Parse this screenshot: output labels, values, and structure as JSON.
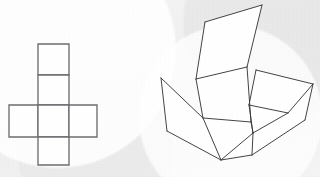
{
  "figure": {
    "background_color": "#f3f3f3",
    "width": 320,
    "height": 177,
    "line_color": "#3a3a3e",
    "net_line_color": "#6e6e72",
    "face_fill": "#ffffff"
  },
  "net": {
    "label": "cube-net-cross",
    "description": "Cross shaped net of six squares: four stacked vertically with two side squares at the third row",
    "square_size": 31,
    "origin": {
      "x": 9,
      "y": 44
    },
    "faces": [
      {
        "name": "net-square-top",
        "points": "38,44 69,44 69,75 38,75"
      },
      {
        "name": "net-square-upper-middle",
        "points": "38,75 69,75 69,105 38,105"
      },
      {
        "name": "net-square-left",
        "points": "9,105 38,105 38,137 9,137"
      },
      {
        "name": "net-square-center",
        "points": "38,105 69,105 69,137 38,137"
      },
      {
        "name": "net-square-right",
        "points": "69,105 97,105 97,137 69,137"
      },
      {
        "name": "net-square-bottom",
        "points": "38,137 69,137 69,165 38,165"
      }
    ]
  },
  "box": {
    "label": "open-box-3d",
    "description": "Three dimensional open box drawn in oblique projection with four unfolded flaps",
    "faces": [
      {
        "name": "box-flap-back-upper",
        "points": "205,22 262,5 247,67 196,79"
      },
      {
        "name": "box-panel-back",
        "points": "196,79 247,67 251,122 203,118"
      },
      {
        "name": "box-panel-left",
        "points": "161,78 203,118 221,160 167,131"
      },
      {
        "name": "box-panel-front",
        "points": "203,118 251,122 253,133 221,160"
      },
      {
        "name": "box-flap-right-upper",
        "points": "256,70 313,84 288,113 249,105"
      },
      {
        "name": "box-panel-right",
        "points": "249,105 288,113 313,84 305,120 252,155 221,160 253,133"
      },
      {
        "name": "box-panel-right-lower",
        "points": "253,133 252,155 305,120 288,113 249,105"
      }
    ],
    "edges": [
      {
        "name": "box-edge-flap-back-left",
        "d": "M205,22 L196,79"
      },
      {
        "name": "box-edge-flap-back-top",
        "d": "M205,22 L262,5"
      },
      {
        "name": "box-edge-flap-back-right",
        "d": "M262,5 L247,67"
      },
      {
        "name": "box-edge-back-fold",
        "d": "M196,79 L247,67"
      },
      {
        "name": "box-edge-back-left-side",
        "d": "M196,79 L203,118"
      },
      {
        "name": "box-edge-back-right-side",
        "d": "M247,67 L251,122"
      },
      {
        "name": "box-edge-back-bottom",
        "d": "M203,118 L251,122"
      },
      {
        "name": "box-edge-left-top",
        "d": "M161,78 L203,118"
      },
      {
        "name": "box-edge-left-outer",
        "d": "M161,78 L167,131"
      },
      {
        "name": "box-edge-left-bottom",
        "d": "M167,131 L221,160"
      },
      {
        "name": "box-edge-left-inner",
        "d": "M203,118 L221,160"
      },
      {
        "name": "box-edge-front-floor",
        "d": "M251,122 L253,133"
      },
      {
        "name": "box-edge-floor-front",
        "d": "M253,133 L221,160"
      },
      {
        "name": "box-edge-right-flap-top",
        "d": "M256,70 L313,84"
      },
      {
        "name": "box-edge-right-flap-left",
        "d": "M256,70 L249,105"
      },
      {
        "name": "box-edge-right-flap-base",
        "d": "M249,105 L288,113"
      },
      {
        "name": "box-edge-right-flap-right",
        "d": "M288,113 L313,84"
      },
      {
        "name": "box-edge-right-outer",
        "d": "M313,84 L305,120"
      },
      {
        "name": "box-edge-right-lower",
        "d": "M305,120 L252,155"
      },
      {
        "name": "box-edge-right-front",
        "d": "M252,155 L221,160"
      },
      {
        "name": "box-edge-right-inner",
        "d": "M288,113 L253,133"
      },
      {
        "name": "box-edge-right-fold",
        "d": "M249,105 L253,133"
      },
      {
        "name": "box-edge-right-crease",
        "d": "M252,155 L253,133"
      }
    ]
  }
}
